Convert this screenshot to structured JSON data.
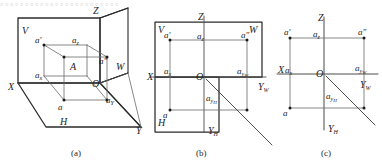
{
  "figure": {
    "title_caption_a": "(a)",
    "title_caption_b": "(b)",
    "title_caption_c": "(c)",
    "background_color": "#ffffff",
    "line_color": "#4a4a4a",
    "heavy_line_color": "#2b2b2b",
    "label_color": "#232323"
  },
  "top_cut_text": {
    "line": "。。。。。。。。。。。。。。。。。。。。。。。。"
  },
  "panel_a": {
    "name": "axonometric-three-plane-view",
    "labels": {
      "plane_v": "V",
      "plane_h": "H",
      "plane_w": "W",
      "axis_x": "X",
      "axis_y": "Y",
      "axis_z": "Z",
      "origin": "O",
      "point_space": "A",
      "proj_front": "a′",
      "proj_top": "a",
      "proj_side": "a″",
      "foot_x": "a",
      "foot_x_sub": "x",
      "foot_y": "a",
      "foot_y_sub": "Y",
      "foot_z": "a",
      "foot_z_sub": "z"
    }
  },
  "panel_b": {
    "name": "unfolded-planes-view",
    "labels": {
      "plane_v": "V",
      "plane_h": "H",
      "plane_w": "W",
      "axis_x": "X",
      "axis_z": "Z",
      "axis_yw": "Y",
      "axis_yw_sub": "W",
      "axis_yh": "Y",
      "axis_yh_sub": "H",
      "origin": "O",
      "proj_front": "a′",
      "proj_top": "a",
      "proj_side": "a″",
      "foot_x": "a",
      "foot_x_sub": "x",
      "foot_z": "a",
      "foot_z_sub": "z",
      "foot_yw": "a",
      "foot_yw_sub": "y",
      "foot_yw_sub2": "W",
      "foot_yh": "a",
      "foot_yh_sub": "y",
      "foot_yh_sub2": "H"
    }
  },
  "panel_c": {
    "name": "final-projection-drawing",
    "labels": {
      "axis_x": "X",
      "axis_z": "Z",
      "axis_yw": "Y",
      "axis_yw_sub": "W",
      "axis_yh": "Y",
      "axis_yh_sub": "H",
      "origin": "O",
      "proj_front": "a′",
      "proj_top": "a",
      "proj_side": "a″",
      "foot_x": "a",
      "foot_x_sub": "x",
      "foot_z": "a",
      "foot_z_sub": "z",
      "foot_yw": "a",
      "foot_yw_sub": "y",
      "foot_yw_sub2": "W",
      "foot_yh": "a",
      "foot_yh_sub": "y",
      "foot_yh_sub2": "H"
    }
  }
}
